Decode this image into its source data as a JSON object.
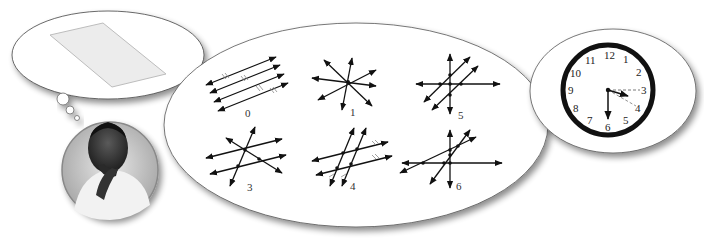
{
  "figures": [
    {
      "label": "0",
      "description": "four parallel lines"
    },
    {
      "label": "1",
      "description": "four concurrent lines"
    },
    {
      "label": "5",
      "description": "two parallel lines crossing two intersecting lines"
    },
    {
      "label": "3",
      "description": "two parallel lines and transversals"
    },
    {
      "label": "4",
      "description": "two pairs of parallel lines"
    },
    {
      "label": "6",
      "description": "four lines in general position"
    }
  ],
  "clock": {
    "numbers": [
      "12",
      "1",
      "2",
      "3",
      "4",
      "5",
      "6",
      "7",
      "8",
      "9",
      "10",
      "11"
    ],
    "time": "6:15 to 6:20"
  },
  "thought_bubble": {
    "content": "parallelogram plane"
  },
  "person": {
    "description": "man thinking, hand on chin"
  }
}
